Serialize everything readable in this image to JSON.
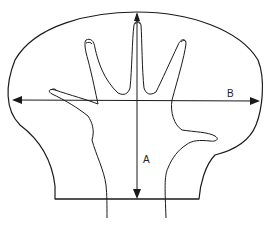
{
  "diagram": {
    "type": "hand measurement diagram",
    "labels": {
      "a": "A",
      "b": "B"
    },
    "measurements": [
      {
        "id": "A",
        "description": "vertical length from fingertip to base line"
      },
      {
        "id": "B",
        "description": "horizontal width across outline"
      }
    ],
    "colors": {
      "line": "#1a1a1a",
      "background": "#ffffff"
    }
  }
}
